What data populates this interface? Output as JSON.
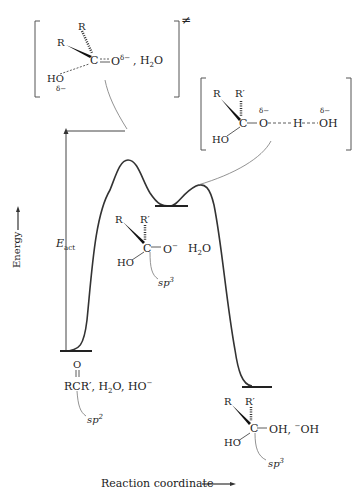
{
  "figure": {
    "y_axis_label": "Energy",
    "x_axis_label": "Reaction coordinate",
    "activation_label": {
      "main": "E",
      "sub": "act"
    }
  },
  "transition_state_1": {
    "bracket_superscript": "≠",
    "atoms": {
      "r1": "R",
      "r2": "R",
      "carbon": "C",
      "oxygen": "O",
      "oxygen_charge": "δ−",
      "water": "H",
      "water_sub": "2",
      "water_o": "O",
      "sep": ",",
      "hydroxyl": "HO",
      "hydroxyl_charge": "δ−"
    }
  },
  "transition_state_2": {
    "atoms": {
      "r1": "R",
      "r2": "R′",
      "carbon": "C",
      "o1": "O",
      "o1_charge": "δ−",
      "h": "H",
      "oh": "OH",
      "oh_charge": "δ−",
      "hydroxyl": "HO"
    }
  },
  "intermediate": {
    "atoms": {
      "r1": "R",
      "r2": "R′",
      "carbon": "C",
      "oxide": "O",
      "oxide_charge": "−",
      "water": "H",
      "water_sub": "2",
      "water_o": "O",
      "hydroxyl": "HO"
    },
    "hybridization": {
      "main": "sp",
      "sup": "3"
    }
  },
  "reactant": {
    "carbonyl_o": "O",
    "formula": "RCR′, H",
    "water_sub": "2",
    "rest": "O, HO",
    "charge": "−",
    "hybridization": {
      "main": "sp",
      "sup": "2"
    }
  },
  "product": {
    "atoms": {
      "r1": "R",
      "r2": "R′",
      "carbon": "C",
      "oh": "OH, ",
      "anion_charge": "−",
      "anion": "OH",
      "hydroxyl": "HO"
    },
    "hybridization": {
      "main": "sp",
      "sup": "3"
    }
  },
  "colors": {
    "line": "#333333",
    "bracket": "#555555",
    "leader": "#777777"
  }
}
